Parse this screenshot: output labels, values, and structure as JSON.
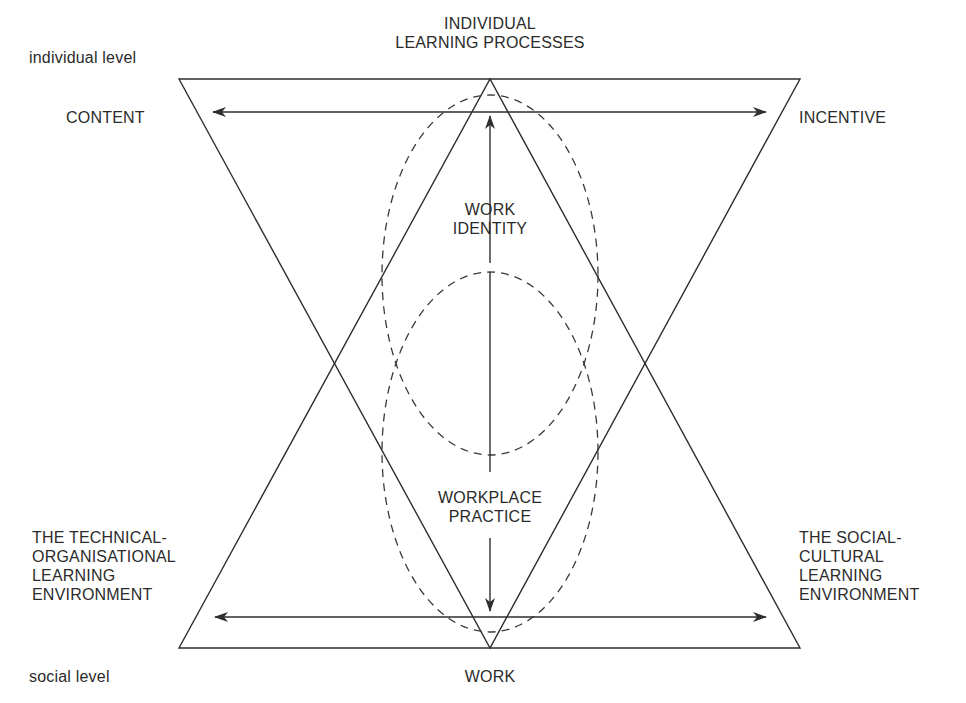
{
  "diagram": {
    "level_labels": {
      "top": "individual level",
      "bottom": "social level"
    },
    "nodes": {
      "top_center": [
        "INDIVIDUAL",
        "LEARNING PROCESSES"
      ],
      "top_left": "CONTENT",
      "top_right": "INCENTIVE",
      "bottom_left": [
        "THE TECHNICAL-",
        "ORGANISATIONAL",
        "LEARNING",
        "ENVIRONMENT"
      ],
      "bottom_right": [
        "THE SOCIAL-",
        "CULTURAL",
        "LEARNING",
        "ENVIRONMENT"
      ],
      "bottom_center": "WORK",
      "middle_upper": [
        "WORK",
        "IDENTITY"
      ],
      "middle_lower": [
        "WORKPLACE",
        "PRACTICE"
      ]
    },
    "shapes": {
      "inverted_triangle": {
        "points": [
          [
            179,
            79
          ],
          [
            800,
            79
          ],
          [
            490,
            648
          ]
        ]
      },
      "upright_triangle": {
        "points": [
          [
            179,
            648
          ],
          [
            800,
            648
          ],
          [
            490,
            79
          ]
        ]
      },
      "arrows": [
        {
          "name": "content-incentive",
          "from": [
            213,
            112
          ],
          "to": [
            766,
            112
          ],
          "heads": "both"
        },
        {
          "name": "environments",
          "from": [
            215,
            617
          ],
          "to": [
            766,
            617
          ],
          "heads": "both"
        },
        {
          "name": "work-identity-up",
          "from": [
            490,
            263
          ],
          "to": [
            490,
            116
          ],
          "heads": "end"
        },
        {
          "name": "workplace-practice-down",
          "from": [
            490,
            538
          ],
          "to": [
            490,
            611
          ],
          "heads": "end"
        }
      ],
      "dashed_ellipses": [
        {
          "name": "upper",
          "cx": 490,
          "cy": 275,
          "rx": 108,
          "ry": 180
        },
        {
          "name": "lower",
          "cx": 490,
          "cy": 452,
          "rx": 108,
          "ry": 180
        }
      ],
      "center_line": {
        "from": [
          490,
          272
        ],
        "to": [
          490,
          472
        ]
      }
    },
    "colors": {
      "stroke": "#2e2e2e",
      "text": "#2b2b2b",
      "background": "#ffffff"
    }
  }
}
